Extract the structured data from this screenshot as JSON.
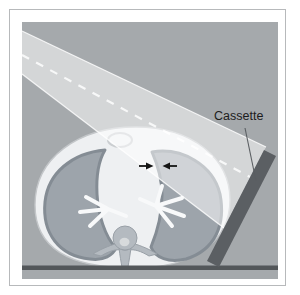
{
  "labels": {
    "cassette": "Cassette"
  },
  "icons": {
    "pointers": [
      "arrow-right-icon",
      "arrow-left-icon"
    ]
  },
  "colors": {
    "page_bg": "#ffffff",
    "frame_border": "#b7b9bb",
    "panel_bg": "#a5a9ac",
    "beam_fill": "rgba(255,255,255,0.52)",
    "beam_edge": "rgba(255,255,255,0.82)",
    "body_fill": "#eef0f2",
    "body_stroke": "#c3c6c9",
    "sternum_stroke": "#cbced1",
    "lung_fill": "#9da4ab",
    "lung_stroke": "#848c94",
    "bronchi": "#f8f9fa",
    "vertebra_fill": "#b4bac0",
    "vertebra_stroke": "#99a0a7",
    "vertebra_inner": "#d7dadc",
    "cassette_fill": "#5b5f63",
    "table_fill": "#53575a",
    "leader": "#5a5e62",
    "label": "#1d1d1d",
    "arrow": "#151515"
  }
}
